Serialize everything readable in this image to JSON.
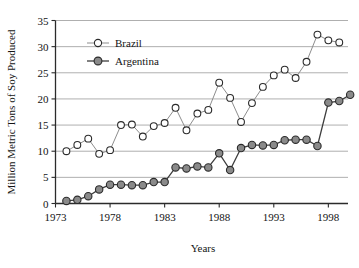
{
  "chart_data": {
    "type": "line",
    "title": "",
    "xlabel": "Years",
    "ylabel": "Million Metric Tons of Soy Produced",
    "xlim": [
      1973,
      1999.8
    ],
    "ylim": [
      0,
      35
    ],
    "yticks": [
      0,
      5,
      10,
      15,
      20,
      25,
      30,
      35
    ],
    "ytick_labels": [
      "0",
      "5",
      "10",
      "15",
      "20",
      "25",
      "30",
      "35"
    ],
    "xticks": [
      1973,
      1978,
      1983,
      1988,
      1993,
      1998
    ],
    "xtick_labels": [
      "1973",
      "1978",
      "1983",
      "1988",
      "1993",
      "1998"
    ],
    "grid": "horizontal",
    "legend_position": "top-left-inside",
    "x": [
      1974,
      1975,
      1976,
      1977,
      1978,
      1979,
      1980,
      1981,
      1982,
      1983,
      1984,
      1985,
      1986,
      1987,
      1988,
      1989,
      1990,
      1991,
      1992,
      1993,
      1994,
      1995,
      1996,
      1997,
      1998,
      1999
    ],
    "series": [
      {
        "name": "Brazil",
        "marker": "open-circle",
        "color": "#ffffff",
        "values": [
          10.0,
          11.2,
          12.4,
          9.5,
          10.2,
          15.0,
          15.1,
          12.8,
          14.8,
          15.4,
          18.3,
          14.0,
          17.2,
          17.9,
          23.1,
          20.2,
          15.6,
          19.2,
          22.3,
          24.5,
          25.6,
          24.0,
          27.1,
          32.3,
          31.2,
          30.8
        ]
      },
      {
        "name": "Argentina",
        "marker": "filled-circle",
        "color": "#8a8a8a",
        "values": [
          0.5,
          0.7,
          1.4,
          2.7,
          3.6,
          3.6,
          3.5,
          3.5,
          4.1,
          4.1,
          6.9,
          6.7,
          7.1,
          6.9,
          9.6,
          6.4,
          10.6,
          11.2,
          11.1,
          11.2,
          12.1,
          12.2,
          12.2,
          11.0,
          19.3,
          19.6
        ]
      }
    ],
    "argentina_extra_point": {
      "x": 2000,
      "y": 20.8
    }
  },
  "legend": {
    "entries": [
      {
        "label": "Brazil",
        "marker": "open-circle"
      },
      {
        "label": "Argentina",
        "marker": "filled-circle"
      }
    ]
  },
  "colors": {
    "brazil_line": "#8d8d8d",
    "argentina_line": "#3d3d3d",
    "argentina_fill": "#8a8a8a",
    "grid": "#9a9a9a",
    "axis": "#2b2b2b",
    "background": "#ffffff"
  }
}
